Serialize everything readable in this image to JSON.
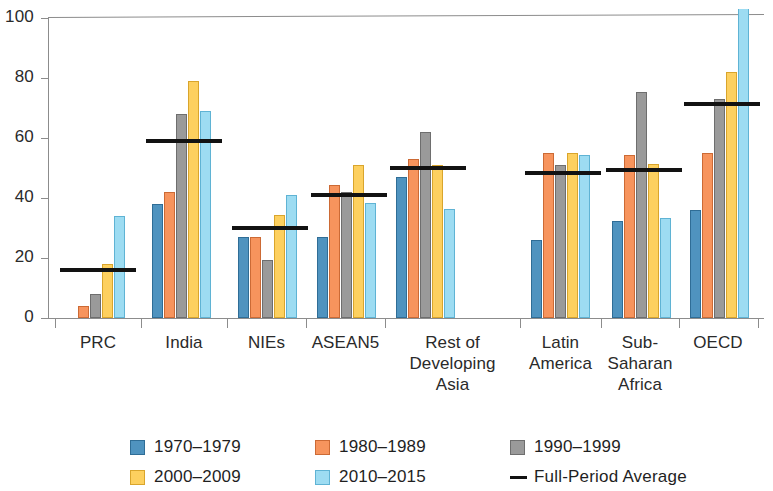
{
  "chart_data": {
    "type": "bar",
    "title": "",
    "subtitle": "",
    "xlabel": "",
    "ylabel": "",
    "ylim": [
      0,
      100
    ],
    "yticks": [
      0,
      20,
      40,
      60,
      80,
      100
    ],
    "grid": false,
    "legend_position": "bottom",
    "categories": [
      "PRC",
      "India",
      "NIEs",
      "ASEAN5",
      "Rest of\nDeveloping\nAsia",
      "Latin\nAmerica",
      "Sub-\nSaharan\nAfrica",
      "OECD"
    ],
    "series": [
      {
        "name": "1970–1979",
        "color": "#4f93bf",
        "values": [
          null,
          38,
          27,
          27,
          47,
          26,
          32.5,
          36
        ]
      },
      {
        "name": "1980–1989",
        "color": "#f7945d",
        "values": [
          4,
          42,
          27,
          44.5,
          53,
          55,
          54.5,
          55
        ]
      },
      {
        "name": "1990–1999",
        "color": "#9a9a9a",
        "values": [
          8,
          68,
          19.5,
          42,
          62,
          51,
          75.5,
          73
        ]
      },
      {
        "name": "2000–2009",
        "color": "#fdd05f",
        "values": [
          18,
          79,
          34.5,
          51,
          51,
          55,
          51.5,
          82
        ]
      },
      {
        "name": "2010–2015",
        "color": "#9ddcf2",
        "values": [
          34,
          69,
          41,
          38.5,
          36.5,
          54.5,
          33.5,
          103
        ]
      }
    ],
    "overlay": {
      "name": "Full-Period Average",
      "color": "#121212",
      "values": [
        16,
        59,
        30,
        41,
        50,
        48.5,
        49.5,
        71.5
      ]
    }
  },
  "axis": {
    "y_tick_labels": [
      "100",
      "80",
      "60",
      "40",
      "20",
      "0"
    ]
  },
  "legend": {
    "items": [
      {
        "label": "1970–1979",
        "swatch": "c1",
        "type": "box"
      },
      {
        "label": "1980–1989",
        "swatch": "c2",
        "type": "box"
      },
      {
        "label": "1990–1999",
        "swatch": "c3",
        "type": "box"
      },
      {
        "label": "2000–2009",
        "swatch": "c4",
        "type": "box"
      },
      {
        "label": "2010–2015",
        "swatch": "c5",
        "type": "box"
      },
      {
        "label": "Full-Period Average",
        "swatch": "line",
        "type": "line"
      }
    ]
  },
  "x_labels": [
    {
      "lines": [
        "PRC"
      ]
    },
    {
      "lines": [
        "India"
      ]
    },
    {
      "lines": [
        "NIEs"
      ]
    },
    {
      "lines": [
        "ASEAN5"
      ]
    },
    {
      "lines": [
        "Rest of",
        "Developing",
        "Asia"
      ]
    },
    {
      "lines": [
        "Latin",
        "America"
      ]
    },
    {
      "lines": [
        "Sub-",
        "Saharan",
        "Africa"
      ]
    },
    {
      "lines": [
        "OECD"
      ]
    }
  ]
}
